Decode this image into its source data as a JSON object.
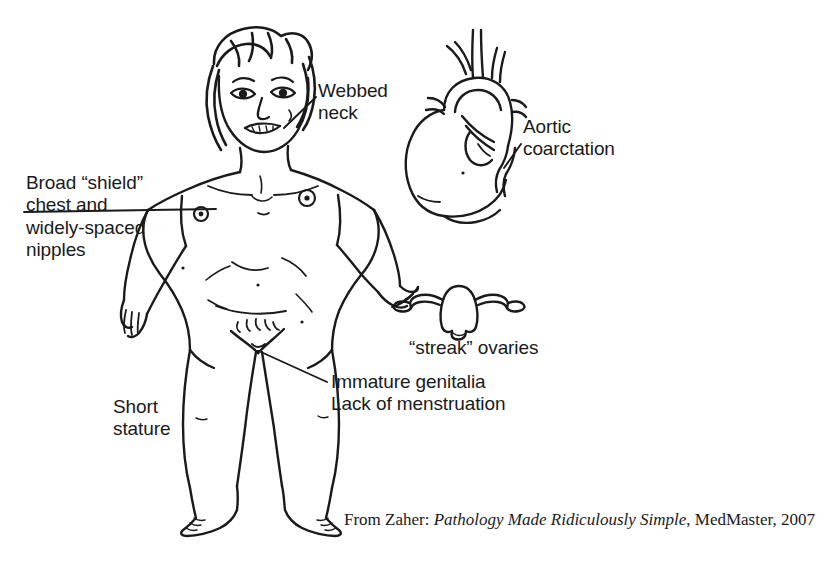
{
  "figure": {
    "alt_description": "Line drawing of a girl with Turner syndrome features, with an inset heart showing aortic coarctation and an inset uterus with streak ovaries",
    "ink_color": "#1a1a1a",
    "background_color": "#ffffff"
  },
  "labels": {
    "webbed_neck": "Webbed\nneck",
    "broad_shield": "Broad “shield”\nchest and\nwidely-spaced\nnipples",
    "aortic_coarctation": "Aortic\ncoarctation",
    "streak_ovaries": "“streak” ovaries",
    "immature_genitalia": "Immature genitalia\nLack of menstruation",
    "short_stature": "Short\nstature"
  },
  "attribution": {
    "prefix": "From Zaher: ",
    "work_title": "Pathology Made Ridiculously Simple",
    "suffix": ", MedMaster, 2007"
  }
}
